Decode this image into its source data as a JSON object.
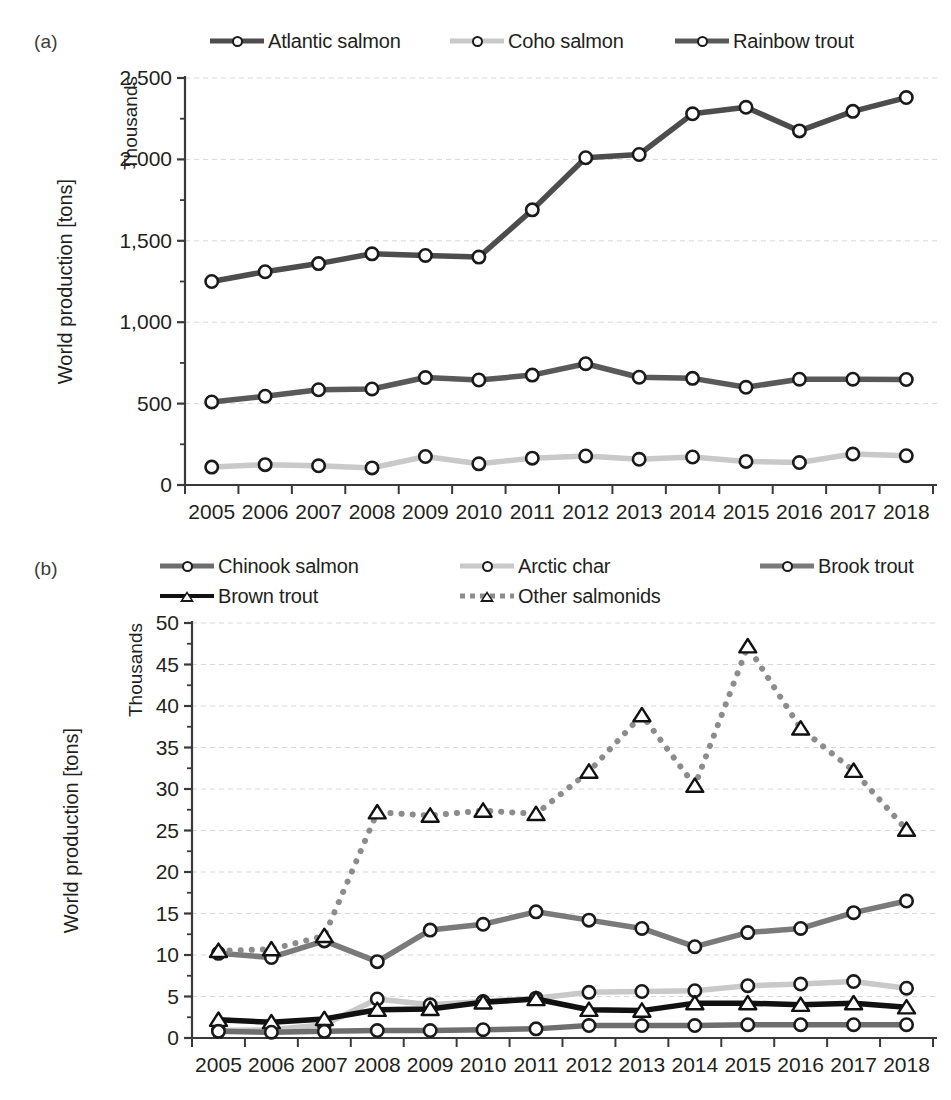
{
  "figure": {
    "panels": [
      {
        "id": "a",
        "label": "(a)",
        "y_axis_title": "World production [tons]",
        "y_units_label": "Thousands",
        "legend_items": [
          {
            "name": "Atlantic salmon",
            "color": "#4d4d4d",
            "marker": "circle",
            "dash": "solid",
            "width": 5
          },
          {
            "name": "Coho salmon",
            "color": "#c9c9c9",
            "marker": "circle",
            "dash": "solid",
            "width": 5
          },
          {
            "name": "Rainbow trout",
            "color": "#595959",
            "marker": "circle",
            "dash": "solid",
            "width": 5
          }
        ]
      },
      {
        "id": "b",
        "label": "(b)",
        "y_axis_title": "World production [tons]",
        "y_units_label": "Thousands",
        "legend_items": [
          {
            "name": "Chinook salmon",
            "color": "#6e6e6e",
            "marker": "circle",
            "dash": "solid",
            "width": 5
          },
          {
            "name": "Arctic char",
            "color": "#c9c9c9",
            "marker": "circle",
            "dash": "solid",
            "width": 5
          },
          {
            "name": "Brook trout",
            "color": "#7a7a7a",
            "marker": "circle",
            "dash": "solid",
            "width": 5
          },
          {
            "name": "Brown trout",
            "color": "#111111",
            "marker": "triangle",
            "dash": "solid",
            "width": 4
          },
          {
            "name": "Other salmonids",
            "color": "#8c8c8c",
            "marker": "triangle",
            "dash": "dotted",
            "width": 5
          }
        ]
      }
    ],
    "caption": ""
  },
  "chart_data": [
    {
      "panel": "a",
      "type": "line",
      "title": "",
      "xlabel": "",
      "ylabel": "World production [tons]",
      "y_units": "Thousands",
      "grid": true,
      "legend_position": "top",
      "x": [
        2005,
        2006,
        2007,
        2008,
        2009,
        2010,
        2011,
        2012,
        2013,
        2014,
        2015,
        2016,
        2017,
        2018
      ],
      "xtick_labels": [
        "2005",
        "2006",
        "2007",
        "2008",
        "2009",
        "2010",
        "2011",
        "2012",
        "2013",
        "2014",
        "2015",
        "2016",
        "2017",
        "2018"
      ],
      "ylim": [
        0,
        2500
      ],
      "yticks": [
        0,
        500,
        1000,
        1500,
        2000,
        2500
      ],
      "ytick_labels": [
        "0",
        "500",
        "1,000",
        "1,500",
        "2,000",
        "2,500"
      ],
      "series": [
        {
          "name": "Atlantic salmon",
          "color": "#4d4d4d",
          "marker": "circle",
          "dash": "solid",
          "values": [
            1250,
            1310,
            1360,
            1420,
            1410,
            1400,
            1690,
            2010,
            2030,
            2280,
            2320,
            2175,
            2295,
            2380
          ]
        },
        {
          "name": "Coho salmon",
          "color": "#c9c9c9",
          "marker": "circle",
          "dash": "solid",
          "values": [
            110,
            125,
            118,
            105,
            175,
            130,
            165,
            178,
            158,
            172,
            145,
            138,
            190,
            180
          ]
        },
        {
          "name": "Rainbow trout",
          "color": "#595959",
          "marker": "circle",
          "dash": "solid",
          "values": [
            510,
            545,
            585,
            590,
            660,
            645,
            675,
            745,
            662,
            655,
            600,
            650,
            650,
            648
          ]
        }
      ]
    },
    {
      "panel": "b",
      "type": "line",
      "title": "",
      "xlabel": "",
      "ylabel": "World production [tons]",
      "y_units": "Thousands",
      "grid": true,
      "legend_position": "top",
      "x": [
        2005,
        2006,
        2007,
        2008,
        2009,
        2010,
        2011,
        2012,
        2013,
        2014,
        2015,
        2016,
        2017,
        2018
      ],
      "xtick_labels": [
        "2005",
        "2006",
        "2007",
        "2008",
        "2009",
        "2010",
        "2011",
        "2012",
        "2013",
        "2014",
        "2015",
        "2016",
        "2017",
        "2018"
      ],
      "ylim": [
        0,
        50
      ],
      "yticks": [
        0,
        5,
        10,
        15,
        20,
        25,
        30,
        35,
        40,
        45,
        50
      ],
      "ytick_labels": [
        "0",
        "5",
        "10",
        "15",
        "20",
        "25",
        "30",
        "35",
        "40",
        "45",
        "50"
      ],
      "series": [
        {
          "name": "Brook trout",
          "color": "#7a7a7a",
          "marker": "circle",
          "dash": "solid",
          "values": [
            10.2,
            9.7,
            11.7,
            9.2,
            13.0,
            13.7,
            15.2,
            14.2,
            13.2,
            11.0,
            12.7,
            13.2,
            15.1,
            16.5
          ]
        },
        {
          "name": "Arctic char",
          "color": "#c9c9c9",
          "marker": "circle",
          "dash": "solid",
          "values": [
            0.9,
            1.0,
            1.6,
            4.7,
            4.0,
            4.4,
            4.8,
            5.5,
            5.6,
            5.7,
            6.3,
            6.5,
            6.8,
            6.0
          ]
        },
        {
          "name": "Brown trout",
          "color": "#111111",
          "marker": "triangle",
          "dash": "solid",
          "values": [
            2.2,
            1.9,
            2.3,
            3.4,
            3.5,
            4.3,
            4.7,
            3.4,
            3.3,
            4.2,
            4.2,
            4.0,
            4.2,
            3.7
          ]
        },
        {
          "name": "Chinook salmon",
          "color": "#6e6e6e",
          "marker": "circle",
          "dash": "solid",
          "values": [
            0.8,
            0.7,
            0.8,
            0.9,
            0.9,
            1.0,
            1.1,
            1.5,
            1.5,
            1.5,
            1.6,
            1.6,
            1.6,
            1.6
          ]
        },
        {
          "name": "Other salmonids",
          "color": "#8c8c8c",
          "marker": "triangle",
          "dash": "dotted",
          "values": [
            10.5,
            10.7,
            12.3,
            27.2,
            26.8,
            27.4,
            27.0,
            32.1,
            38.9,
            30.4,
            47.2,
            37.3,
            32.2,
            25.1
          ]
        }
      ]
    }
  ]
}
